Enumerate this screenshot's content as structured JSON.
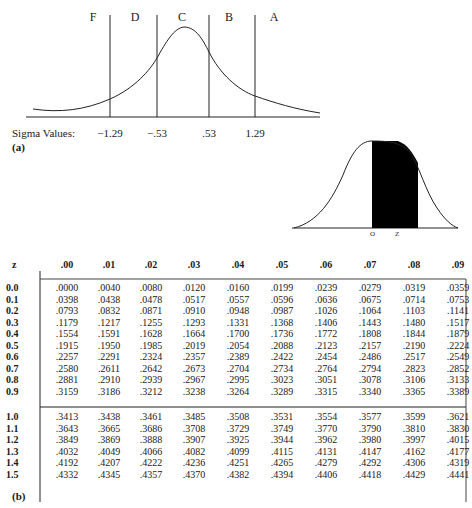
{
  "figure_a": {
    "panel_label": "(a)",
    "grade_regions": [
      "F",
      "D",
      "C",
      "B",
      "A"
    ],
    "sigma_label": "Sigma Values:",
    "sigma_values": [
      "−1.29",
      "−.53",
      ".53",
      "1.29"
    ]
  },
  "figure_shaded": {
    "left_label": "O",
    "right_label": "Z"
  },
  "table": {
    "z_header": "z",
    "columns": [
      ".00",
      ".01",
      ".02",
      ".03",
      ".04",
      ".05",
      ".06",
      ".07",
      ".08",
      ".09"
    ],
    "group1": [
      {
        "z": "0.0",
        "values": [
          ".0000",
          ".0040",
          ".0080",
          ".0120",
          ".0160",
          ".0199",
          ".0239",
          ".0279",
          ".0319",
          ".0359"
        ]
      },
      {
        "z": "0.1",
        "values": [
          ".0398",
          ".0438",
          ".0478",
          ".0517",
          ".0557",
          ".0596",
          ".0636",
          ".0675",
          ".0714",
          ".0753"
        ]
      },
      {
        "z": "0.2",
        "values": [
          ".0793",
          ".0832",
          ".0871",
          ".0910",
          ".0948",
          ".0987",
          ".1026",
          ".1064",
          ".1103",
          ".1141"
        ]
      },
      {
        "z": "0.3",
        "values": [
          ".1179",
          ".1217",
          ".1255",
          ".1293",
          ".1331",
          ".1368",
          ".1406",
          ".1443",
          ".1480",
          ".1517"
        ]
      },
      {
        "z": "0.4",
        "values": [
          ".1554",
          ".1591",
          ".1628",
          ".1664",
          ".1700",
          ".1736",
          ".1772",
          ".1808",
          ".1844",
          ".1879"
        ]
      },
      {
        "z": "0.5",
        "values": [
          ".1915",
          ".1950",
          ".1985",
          ".2019",
          ".2054",
          ".2088",
          ".2123",
          ".2157",
          ".2190",
          ".2224"
        ]
      },
      {
        "z": "0.6",
        "values": [
          ".2257",
          ".2291",
          ".2324",
          ".2357",
          ".2389",
          ".2422",
          ".2454",
          ".2486",
          ".2517",
          ".2549"
        ]
      },
      {
        "z": "0.7",
        "values": [
          ".2580",
          ".2611",
          ".2642",
          ".2673",
          ".2704",
          ".2734",
          ".2764",
          ".2794",
          ".2823",
          ".2852"
        ]
      },
      {
        "z": "0.8",
        "values": [
          ".2881",
          ".2910",
          ".2939",
          ".2967",
          ".2995",
          ".3023",
          ".3051",
          ".3078",
          ".3106",
          ".3133"
        ]
      },
      {
        "z": "0.9",
        "values": [
          ".3159",
          ".3186",
          ".3212",
          ".3238",
          ".3264",
          ".3289",
          ".3315",
          ".3340",
          ".3365",
          ".3389"
        ]
      }
    ],
    "group2": [
      {
        "z": "1.0",
        "values": [
          ".3413",
          ".3438",
          ".3461",
          ".3485",
          ".3508",
          ".3531",
          ".3554",
          ".3577",
          ".3599",
          ".3621"
        ]
      },
      {
        "z": "1.1",
        "values": [
          ".3643",
          ".3665",
          ".3686",
          ".3708",
          ".3729",
          ".3749",
          ".3770",
          ".3790",
          ".3810",
          ".3830"
        ]
      },
      {
        "z": "1.2",
        "values": [
          ".3849",
          ".3869",
          ".3888",
          ".3907",
          ".3925",
          ".3944",
          ".3962",
          ".3980",
          ".3997",
          ".4015"
        ]
      },
      {
        "z": "1.3",
        "values": [
          ".4032",
          ".4049",
          ".4066",
          ".4082",
          ".4099",
          ".4115",
          ".4131",
          ".4147",
          ".4162",
          ".4177"
        ]
      },
      {
        "z": "1.4",
        "values": [
          ".4192",
          ".4207",
          ".4222",
          ".4236",
          ".4251",
          ".4265",
          ".4279",
          ".4292",
          ".4306",
          ".4319"
        ]
      },
      {
        "z": "1.5",
        "values": [
          ".4332",
          ".4345",
          ".4357",
          ".4370",
          ".4382",
          ".4394",
          ".4406",
          ".4418",
          ".4429",
          ".4441"
        ]
      }
    ],
    "panel_label": "(b)"
  }
}
